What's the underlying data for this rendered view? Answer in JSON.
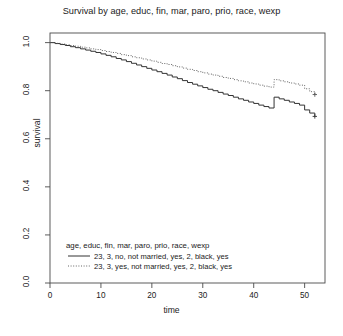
{
  "chart_data": {
    "type": "line",
    "title": "Survival by age, educ, fin, mar, paro, prio, race, wexp",
    "xlabel": "time",
    "ylabel": "survival",
    "xlim": [
      0,
      54
    ],
    "ylim": [
      0,
      1.04
    ],
    "xticks": [
      0,
      10,
      20,
      30,
      40,
      50
    ],
    "xtick_labels": [
      "0",
      "10",
      "20",
      "30",
      "40",
      "50"
    ],
    "yticks": [
      0.0,
      0.2,
      0.4,
      0.6,
      0.8,
      1.0
    ],
    "ytick_labels": [
      "0.0",
      "0.2",
      "0.4",
      "0.6",
      "0.8",
      "1.0"
    ],
    "grid": false,
    "legend_position": "bottom-left",
    "legend_title": "age, educ, fin, mar, paro, prio, race, wexp",
    "series": [
      {
        "name": "23, 3, no, not married, yes, 2, black, yes",
        "linestyle": "solid",
        "color": "#333333",
        "censor_marker": "+",
        "censor_points": [
          [
            52.0,
            0.693
          ]
        ],
        "x": [
          0,
          1,
          2,
          3,
          4,
          5,
          6,
          7,
          8,
          9,
          10,
          11,
          12,
          13,
          14,
          15,
          16,
          17,
          18,
          19,
          20,
          21,
          22,
          23,
          24,
          25,
          26,
          27,
          28,
          29,
          30,
          31,
          32,
          33,
          34,
          35,
          36,
          37,
          38,
          39,
          40,
          41,
          42,
          43,
          44,
          45,
          46,
          47,
          48,
          49,
          50,
          51,
          52
        ],
        "y": [
          1.0,
          0.996,
          0.992,
          0.988,
          0.983,
          0.979,
          0.974,
          0.969,
          0.964,
          0.959,
          0.953,
          0.947,
          0.941,
          0.934,
          0.928,
          0.921,
          0.914,
          0.907,
          0.9,
          0.893,
          0.886,
          0.879,
          0.872,
          0.865,
          0.857,
          0.85,
          0.842,
          0.834,
          0.827,
          0.82,
          0.813,
          0.806,
          0.8,
          0.793,
          0.786,
          0.78,
          0.773,
          0.766,
          0.76,
          0.753,
          0.747,
          0.74,
          0.734,
          0.728,
          0.773,
          0.766,
          0.76,
          0.753,
          0.747,
          0.74,
          0.72,
          0.707,
          0.693
        ]
      },
      {
        "name": "23, 3, yes, not married, yes, 2, black, yes",
        "linestyle": "dotted",
        "color": "#555555",
        "censor_marker": "+",
        "censor_points": [
          [
            52.0,
            0.784
          ]
        ],
        "x": [
          0,
          1,
          2,
          3,
          4,
          5,
          6,
          7,
          8,
          9,
          10,
          11,
          12,
          13,
          14,
          15,
          16,
          17,
          18,
          19,
          20,
          21,
          22,
          23,
          24,
          25,
          26,
          27,
          28,
          29,
          30,
          31,
          32,
          33,
          34,
          35,
          36,
          37,
          38,
          39,
          40,
          41,
          42,
          43,
          44,
          45,
          46,
          47,
          48,
          49,
          50,
          51,
          52
        ],
        "y": [
          1.0,
          0.997,
          0.994,
          0.991,
          0.988,
          0.985,
          0.981,
          0.978,
          0.974,
          0.971,
          0.967,
          0.963,
          0.959,
          0.955,
          0.95,
          0.946,
          0.941,
          0.937,
          0.932,
          0.928,
          0.923,
          0.918,
          0.913,
          0.909,
          0.904,
          0.899,
          0.894,
          0.889,
          0.884,
          0.879,
          0.874,
          0.869,
          0.865,
          0.86,
          0.855,
          0.851,
          0.846,
          0.841,
          0.837,
          0.832,
          0.828,
          0.823,
          0.819,
          0.815,
          0.846,
          0.841,
          0.837,
          0.832,
          0.828,
          0.823,
          0.808,
          0.796,
          0.784
        ]
      }
    ]
  },
  "legend": {
    "title": "age, educ, fin, mar, paro, prio, race, wexp",
    "entries": [
      {
        "label": "23, 3, no, not married, yes, 2, black, yes"
      },
      {
        "label": "23, 3, yes, not married, yes, 2, black, yes"
      }
    ]
  }
}
